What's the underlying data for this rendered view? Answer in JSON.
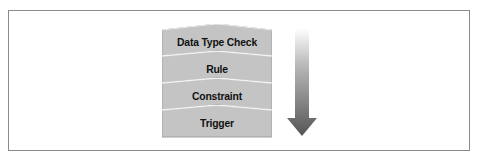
{
  "diagram": {
    "type": "layered-stack-with-direction-arrow",
    "layers": [
      {
        "label": "Data Type Check"
      },
      {
        "label": "Rule"
      },
      {
        "label": "Constraint"
      },
      {
        "label": "Trigger"
      }
    ],
    "arrow": {
      "direction": "down",
      "icon": "arrow-down-gradient"
    },
    "colors": {
      "layer_fill": "#c4c4c4",
      "layer_edge": "#9a9a9a",
      "arrow_top": "#ffffff",
      "arrow_bottom": "#555555",
      "frame_border": "#8a8a8a"
    }
  }
}
